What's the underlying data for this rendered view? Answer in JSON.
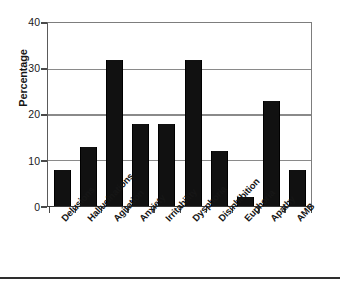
{
  "chart_data": {
    "type": "bar",
    "title": "",
    "xlabel": "",
    "ylabel": "Percentage",
    "ylim": [
      0,
      40
    ],
    "yticks": [
      0,
      10,
      20,
      30,
      40
    ],
    "grid": true,
    "legend": null,
    "categories": [
      "Delusions",
      "Hallucinations",
      "Agitation",
      "Anxiety",
      "Irritability",
      "Dysphoria",
      "Disinhibition",
      "Euphoria",
      "Apathy",
      "AMB"
    ],
    "values": [
      8,
      13,
      32,
      18,
      18,
      32,
      12,
      2,
      23,
      8
    ],
    "bar_color": "#111111"
  },
  "axis": {
    "y_title": "Percentage",
    "y_tick_labels": [
      "40",
      "30",
      "20",
      "10",
      "0"
    ]
  }
}
